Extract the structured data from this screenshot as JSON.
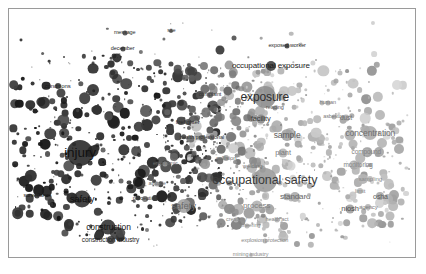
{
  "chart_data": {
    "type": "scatter",
    "title": "",
    "subtitle": "",
    "xlabel": "",
    "ylabel": "",
    "xlim": [
      0,
      100
    ],
    "ylim": [
      0,
      100
    ],
    "grid": false,
    "legend": "none",
    "encoding": {
      "size": "term frequency (bubble radius)",
      "color": "cluster darkness, dark = occupational injury/safety cluster, light gray = exposure/measurement cluster",
      "position": "2-D semantic embedding projection"
    },
    "colors": {
      "background": "#ffffff",
      "border": "#9a9a9a",
      "cluster_dark": "#2e2e2e",
      "cluster_mid": "#6f6f6f",
      "cluster_light": "#b4b4b4",
      "label_dark": "#1a1a1a",
      "label_light": "#9e9e9e"
    },
    "points": [
      {
        "label": "injury",
        "x": 17.5,
        "y": 58.0,
        "size": 26,
        "color": "#242424",
        "fontsize": 13.5,
        "labelcolor": "#111111",
        "showlabel": true
      },
      {
        "label": "occupational safety",
        "x": 63.0,
        "y": 69.0,
        "size": 24,
        "color": "#9a9a9a",
        "fontsize": 12.5,
        "labelcolor": "#3b3b3b",
        "showlabel": true
      },
      {
        "label": "exposure",
        "x": 63.0,
        "y": 35.5,
        "size": 22,
        "color": "#8e8e8e",
        "fontsize": 12.0,
        "labelcolor": "#2f2f2f",
        "showlabel": true
      },
      {
        "label": "occupational exposure",
        "x": 64.5,
        "y": 23.0,
        "size": 10,
        "color": "#3c3c3c",
        "fontsize": 8.0,
        "labelcolor": "#1a1a1a",
        "showlabel": true
      },
      {
        "label": "safety",
        "x": 18.0,
        "y": 76.5,
        "size": 17,
        "color": "#2b2b2b",
        "fontsize": 9.5,
        "labelcolor": "#111111",
        "showlabel": true
      },
      {
        "label": "safety",
        "x": 43.0,
        "y": 79.5,
        "size": 14,
        "color": "#a2a2a2",
        "fontsize": 9.5,
        "labelcolor": "#6a6a6a",
        "showlabel": true
      },
      {
        "label": "concentration",
        "x": 89.0,
        "y": 50.0,
        "size": 14,
        "color": "#ababab",
        "fontsize": 8.5,
        "labelcolor": "#6f6f6f",
        "showlabel": true
      },
      {
        "label": "sample",
        "x": 68.5,
        "y": 51.0,
        "size": 12,
        "color": "#9e9e9e",
        "fontsize": 8.5,
        "labelcolor": "#5e5e5e",
        "showlabel": true
      },
      {
        "label": "construction",
        "x": 24.5,
        "y": 88.0,
        "size": 15,
        "color": "#2f2f2f",
        "fontsize": 8.5,
        "labelcolor": "#141414",
        "showlabel": true
      },
      {
        "label": "construction industry",
        "x": 25.0,
        "y": 93.0,
        "size": 8,
        "color": "#3a3a3a",
        "fontsize": 6.5,
        "labelcolor": "#1d1d1d",
        "showlabel": true
      },
      {
        "label": "standard",
        "x": 70.5,
        "y": 76.0,
        "size": 10,
        "color": "#a8a8a8",
        "fontsize": 8.0,
        "labelcolor": "#666666",
        "showlabel": true
      },
      {
        "label": "process",
        "x": 61.0,
        "y": 79.5,
        "size": 11,
        "color": "#b0b0b0",
        "fontsize": 8.0,
        "labelcolor": "#808080",
        "showlabel": true
      },
      {
        "label": "niosh",
        "x": 84.0,
        "y": 80.5,
        "size": 9,
        "color": "#9d9d9d",
        "fontsize": 7.5,
        "labelcolor": "#4f4f4f",
        "showlabel": true
      },
      {
        "label": "osha",
        "x": 91.5,
        "y": 75.5,
        "size": 8,
        "color": "#a5a5a5",
        "fontsize": 7.0,
        "labelcolor": "#5a5a5a",
        "showlabel": true
      },
      {
        "label": "facility",
        "x": 62.0,
        "y": 44.5,
        "size": 9,
        "color": "#8a8a8a",
        "fontsize": 7.5,
        "labelcolor": "#3d3d3d",
        "showlabel": true
      },
      {
        "label": "plant",
        "x": 67.5,
        "y": 58.0,
        "size": 9,
        "color": "#b2b2b2",
        "fontsize": 7.5,
        "labelcolor": "#7b7b7b",
        "showlabel": true
      },
      {
        "label": "compound",
        "x": 88.0,
        "y": 57.5,
        "size": 7,
        "color": "#b0b0b0",
        "fontsize": 6.5,
        "labelcolor": "#828282",
        "showlabel": true
      },
      {
        "label": "monitoring",
        "x": 86.0,
        "y": 63.0,
        "size": 7,
        "color": "#b2b2b2",
        "fontsize": 6.5,
        "labelcolor": "#858585",
        "showlabel": true
      },
      {
        "label": "sampling",
        "x": 89.0,
        "y": 68.5,
        "size": 6,
        "color": "#b6b6b6",
        "fontsize": 6.0,
        "labelcolor": "#8a8a8a",
        "showlabel": true
      },
      {
        "label": "dust",
        "x": 83.0,
        "y": 44.0,
        "size": 7,
        "color": "#a8a8a8",
        "fontsize": 6.5,
        "labelcolor": "#6e6e6e",
        "showlabel": true
      },
      {
        "label": "limit",
        "x": 86.5,
        "y": 73.5,
        "size": 6,
        "color": "#b4b4b4",
        "fontsize": 6.0,
        "labelcolor": "#888888",
        "showlabel": true
      },
      {
        "label": "agency",
        "x": 88.5,
        "y": 80.0,
        "size": 6,
        "color": "#b0b0b0",
        "fontsize": 6.0,
        "labelcolor": "#7d7d7d",
        "showlabel": true
      },
      {
        "label": "firefighter",
        "x": 44.0,
        "y": 45.5,
        "size": 6,
        "color": "#555555",
        "fontsize": 6.0,
        "labelcolor": "#2a2a2a",
        "showlabel": true
      },
      {
        "label": "health professional",
        "x": 47.5,
        "y": 52.0,
        "size": 6,
        "color": "#5c5c5c",
        "fontsize": 5.5,
        "labelcolor": "#303030",
        "showlabel": true
      },
      {
        "label": "complaint",
        "x": 49.5,
        "y": 34.5,
        "size": 6,
        "color": "#5f5f5f",
        "fontsize": 5.5,
        "labelcolor": "#333333",
        "showlabel": true
      },
      {
        "label": "exposed worker",
        "x": 68.5,
        "y": 15.0,
        "size": 5,
        "color": "#3b3b3b",
        "fontsize": 5.5,
        "labelcolor": "#2b2b2b",
        "showlabel": true
      },
      {
        "label": "collision",
        "x": 53.5,
        "y": 60.0,
        "size": 6,
        "color": "#9c9c9c",
        "fontsize": 6.0,
        "labelcolor": "#6a6a6a",
        "showlabel": true
      },
      {
        "label": "welding",
        "x": 60.0,
        "y": 63.5,
        "size": 5,
        "color": "#a6a6a6",
        "fontsize": 6.0,
        "labelcolor": "#747474",
        "showlabel": true
      },
      {
        "label": "ergonomic",
        "x": 38.5,
        "y": 62.5,
        "size": 5,
        "color": "#9a9a9a",
        "fontsize": 5.5,
        "labelcolor": "#6b6b6b",
        "showlabel": true
      },
      {
        "label": "attitude",
        "x": 36.5,
        "y": 70.5,
        "size": 5,
        "color": "#9f9f9f",
        "fontsize": 5.5,
        "labelcolor": "#6e6e6e",
        "showlabel": true
      },
      {
        "label": "perception",
        "x": 33.5,
        "y": 76.5,
        "size": 6,
        "color": "#6d6d6d",
        "fontsize": 5.5,
        "labelcolor": "#3a3a3a",
        "showlabel": true
      },
      {
        "label": "surveillance",
        "x": 7.0,
        "y": 75.5,
        "size": 5,
        "color": "#333333",
        "fontsize": 5.5,
        "labelcolor": "#171717",
        "showlabel": true
      },
      {
        "label": "engineering",
        "x": 58.5,
        "y": 87.5,
        "size": 5,
        "color": "#b4b4b4",
        "fontsize": 5.5,
        "labelcolor": "#878787",
        "showlabel": true
      },
      {
        "label": "health act",
        "x": 66.0,
        "y": 85.0,
        "size": 5,
        "color": "#b0b0b0",
        "fontsize": 5.5,
        "labelcolor": "#838383",
        "showlabel": true
      },
      {
        "label": "creativity",
        "x": 56.0,
        "y": 85.0,
        "size": 5,
        "color": "#b6b6b6",
        "fontsize": 5.5,
        "labelcolor": "#8a8a8a",
        "showlabel": true
      },
      {
        "label": "explosion protection",
        "x": 63.0,
        "y": 93.5,
        "size": 5,
        "color": "#b2b2b2",
        "fontsize": 5.5,
        "labelcolor": "#868686",
        "showlabel": true
      },
      {
        "label": "mining industry",
        "x": 59.5,
        "y": 99.0,
        "size": 4,
        "color": "#b8b8b8",
        "fontsize": 5.5,
        "labelcolor": "#8c8c8c",
        "showlabel": true
      },
      {
        "label": "human",
        "x": 78.5,
        "y": 38.0,
        "size": 5,
        "color": "#a8a8a8",
        "fontsize": 5.5,
        "labelcolor": "#787878",
        "showlabel": true
      },
      {
        "label": "asbestos",
        "x": 80.0,
        "y": 43.5,
        "size": 5,
        "color": "#aaaaaa",
        "fontsize": 5.5,
        "labelcolor": "#7a7a7a",
        "showlabel": true
      },
      {
        "label": "reading",
        "x": 65.5,
        "y": 40.0,
        "size": 5,
        "color": "#8c8c8c",
        "fontsize": 5.5,
        "labelcolor": "#555555",
        "showlabel": true
      },
      {
        "label": "message",
        "x": 28.5,
        "y": 9.5,
        "size": 5,
        "color": "#4a4a4a",
        "fontsize": 5.5,
        "labelcolor": "#2e2e2e",
        "showlabel": true
      },
      {
        "label": "december",
        "x": 28.0,
        "y": 16.0,
        "size": 5,
        "color": "#3e3e3e",
        "fontsize": 5.5,
        "labelcolor": "#242424",
        "showlabel": true
      },
      {
        "label": "site",
        "x": 40.0,
        "y": 9.0,
        "size": 4,
        "color": "#555555",
        "fontsize": 5.5,
        "labelcolor": "#343434",
        "showlabel": true
      },
      {
        "label": "conditions",
        "x": 12.0,
        "y": 31.0,
        "size": 6,
        "color": "#3a3a3a",
        "fontsize": 6.0,
        "labelcolor": "#1c1c1c",
        "showlabel": true
      },
      {
        "label": "training",
        "x": 25.0,
        "y": 22.0,
        "size": 7,
        "color": "#333333",
        "fontsize": 5.5,
        "labelcolor": "#1a1a1a",
        "showlabel": false
      },
      {
        "label": "health",
        "x": 52.0,
        "y": 16.5,
        "size": 9,
        "color": "#2d2d2d",
        "fontsize": 6.5,
        "labelcolor": "#141414",
        "showlabel": false
      },
      {
        "label": "control",
        "x": 55.5,
        "y": 11.5,
        "size": 5,
        "color": "#4a4a4a",
        "fontsize": 5.5,
        "labelcolor": "#2b2b2b",
        "showlabel": false
      },
      {
        "label": "dose",
        "x": 80.5,
        "y": 29.0,
        "size": 5,
        "color": "#a4a4a4",
        "fontsize": 5.5,
        "labelcolor": "#757575",
        "showlabel": false
      },
      {
        "label": "vapor",
        "x": 84.0,
        "y": 34.5,
        "size": 5,
        "color": "#a6a6a6",
        "fontsize": 5.5,
        "labelcolor": "#777777",
        "showlabel": false
      },
      {
        "label": "respirator",
        "x": 96.0,
        "y": 46.0,
        "size": 5,
        "color": "#acacac",
        "fontsize": 5.5,
        "labelcolor": "#7c7c7c",
        "showlabel": false
      },
      {
        "label": "fiber",
        "x": 94.5,
        "y": 52.0,
        "size": 4,
        "color": "#b0b0b0",
        "fontsize": 5.5,
        "labelcolor": "#808080",
        "showlabel": false
      },
      {
        "label": "accuracy",
        "x": 90.5,
        "y": 86.5,
        "size": 4,
        "color": "#b4b4b4",
        "fontsize": 5.5,
        "labelcolor": "#868686",
        "showlabel": false
      },
      {
        "label": "threshold",
        "x": 76.0,
        "y": 87.0,
        "size": 4,
        "color": "#b4b4b4",
        "fontsize": 5.5,
        "labelcolor": "#868686",
        "showlabel": false
      },
      {
        "label": "element",
        "x": 52.0,
        "y": 79.0,
        "size": 4,
        "color": "#b6b6b6",
        "fontsize": 5.5,
        "labelcolor": "#8a8a8a",
        "showlabel": false
      },
      {
        "label": "topic",
        "x": 48.0,
        "y": 63.0,
        "size": 4,
        "color": "#9e9e9e",
        "fontsize": 5.5,
        "labelcolor": "#707070",
        "showlabel": false
      },
      {
        "label": "accident",
        "x": 27.5,
        "y": 69.5,
        "size": 5,
        "color": "#5a5a5a",
        "fontsize": 5.5,
        "labelcolor": "#2f2f2f",
        "showlabel": false
      },
      {
        "label": "road",
        "x": 15.0,
        "y": 86.5,
        "size": 4,
        "color": "#3c3c3c",
        "fontsize": 5.5,
        "labelcolor": "#1f1f1f",
        "showlabel": false
      },
      {
        "label": "safety professional",
        "x": 34.0,
        "y": 89.0,
        "size": 4,
        "color": "#6e6e6e",
        "fontsize": 5.5,
        "labelcolor": "#3a3a3a",
        "showlabel": false
      },
      {
        "label": "safety indicator",
        "x": 73.0,
        "y": 70.0,
        "size": 4,
        "color": "#b4b4b4",
        "fontsize": 5.5,
        "labelcolor": "#878787",
        "showlabel": false
      },
      {
        "label": "accident rate",
        "x": 74.0,
        "y": 75.0,
        "size": 4,
        "color": "#b2b2b2",
        "fontsize": 5.5,
        "labelcolor": "#858585",
        "showlabel": false
      }
    ]
  }
}
